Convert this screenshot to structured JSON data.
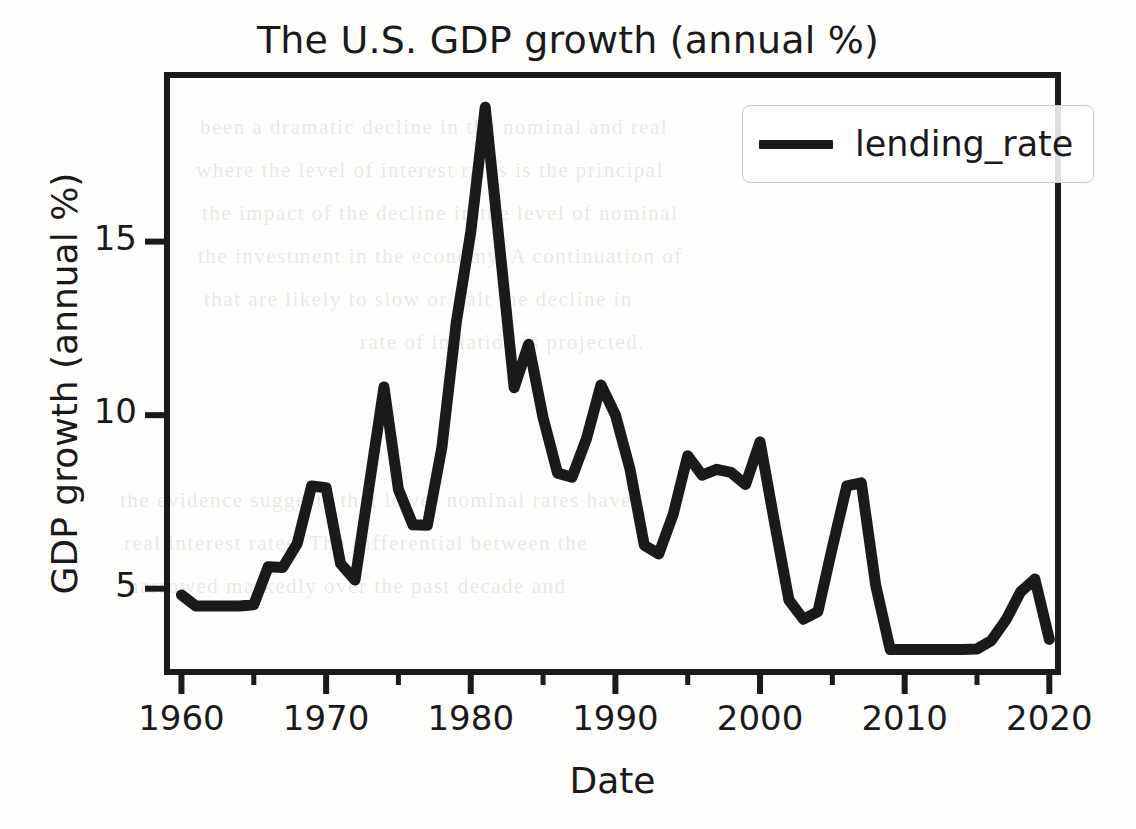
{
  "chart_data": {
    "type": "line",
    "title": "The U.S. GDP growth (annual %)",
    "xlabel": "Date",
    "ylabel": "GDP growth (annual %)",
    "xlim": [
      1959.0,
      1920.0
    ],
    "x_range": [
      1959.0,
      2020.6
    ],
    "ylim": [
      2.6,
      19.8
    ],
    "grid": false,
    "legend_position": "upper right",
    "x_ticks": [
      1960,
      1970,
      1980,
      1990,
      2000,
      2010,
      2020
    ],
    "x_tick_labels": [
      "1960",
      "1970",
      "1980",
      "1990",
      "2000",
      "2010",
      "2020"
    ],
    "x_minor_ticks": [
      1965,
      1975,
      1985,
      1995,
      2005,
      2015
    ],
    "y_ticks": [
      5,
      10,
      15
    ],
    "y_tick_labels": [
      "5",
      "10",
      "15"
    ],
    "series": [
      {
        "name": "lending_rate",
        "color": "#1a1a1a",
        "linewidth": 11,
        "x": [
          1960,
          1961,
          1962,
          1963,
          1964,
          1965,
          1966,
          1967,
          1968,
          1969,
          1970,
          1971,
          1972,
          1973,
          1974,
          1975,
          1976,
          1977,
          1978,
          1979,
          1980,
          1981,
          1982,
          1983,
          1984,
          1985,
          1986,
          1987,
          1988,
          1989,
          1990,
          1991,
          1992,
          1993,
          1994,
          1995,
          1996,
          1997,
          1998,
          1999,
          2000,
          2001,
          2002,
          2003,
          2004,
          2005,
          2006,
          2007,
          2008,
          2009,
          2010,
          2011,
          2012,
          2013,
          2014,
          2015,
          2016,
          2017,
          2018,
          2019,
          2020
        ],
        "y": [
          4.82,
          4.5,
          4.5,
          4.5,
          4.5,
          4.54,
          5.63,
          5.61,
          6.3,
          7.96,
          7.91,
          5.72,
          5.25,
          8.03,
          10.81,
          7.86,
          6.84,
          6.83,
          9.06,
          12.67,
          15.27,
          18.87,
          14.86,
          10.79,
          12.04,
          9.93,
          8.33,
          8.21,
          9.32,
          10.87,
          10.01,
          8.46,
          6.25,
          6.0,
          7.15,
          8.83,
          8.27,
          8.44,
          8.35,
          8.0,
          9.23,
          6.91,
          4.67,
          4.12,
          4.34,
          6.19,
          7.96,
          8.05,
          5.09,
          3.25,
          3.25,
          3.25,
          3.25,
          3.25,
          3.25,
          3.26,
          3.51,
          4.1,
          4.9,
          5.28,
          3.54
        ]
      }
    ]
  },
  "legend": {
    "label": "lending_rate"
  },
  "background_text": [
    "been a dramatic decline in the nominal and real",
    "where the level of interest rates is the principal",
    "the impact of the decline in the level of nominal",
    "the investment in the economy. A continuation of",
    "that are likely to slow or halt the decline in",
    "rate of inflation is projected."
  ],
  "background_text_2": [
    "the evidence suggests that lower nominal rates have",
    "real interest rates. The differential between the",
    "narrowed markedly over the past decade and"
  ]
}
